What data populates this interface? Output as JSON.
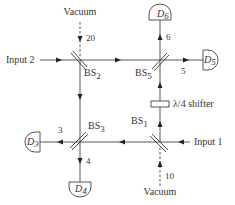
{
  "diagram": {
    "sources": {
      "vacuum_top": "Vacuum",
      "vacuum_bottom": "Vacuum",
      "input_1": "Input 1",
      "input_2": "Input 2"
    },
    "beam_splitters": {
      "bs1": {
        "base": "BS",
        "sub": "1"
      },
      "bs2": {
        "base": "BS",
        "sub": "2"
      },
      "bs3": {
        "base": "BS",
        "sub": "3"
      },
      "bs5": {
        "base": "BS",
        "sub": "5"
      }
    },
    "detectors": {
      "d3": {
        "base": "D",
        "sub": "3"
      },
      "d4": {
        "base": "D",
        "sub": "4"
      },
      "d5": {
        "base": "D",
        "sub": "5"
      },
      "d6": {
        "base": "D",
        "sub": "6"
      }
    },
    "mode_labels": {
      "m3": "3",
      "m4": "4",
      "m5": "5",
      "m6": "6",
      "m10": "10",
      "m20": "20"
    },
    "shifter": {
      "label": "λ/4 shifter"
    }
  }
}
